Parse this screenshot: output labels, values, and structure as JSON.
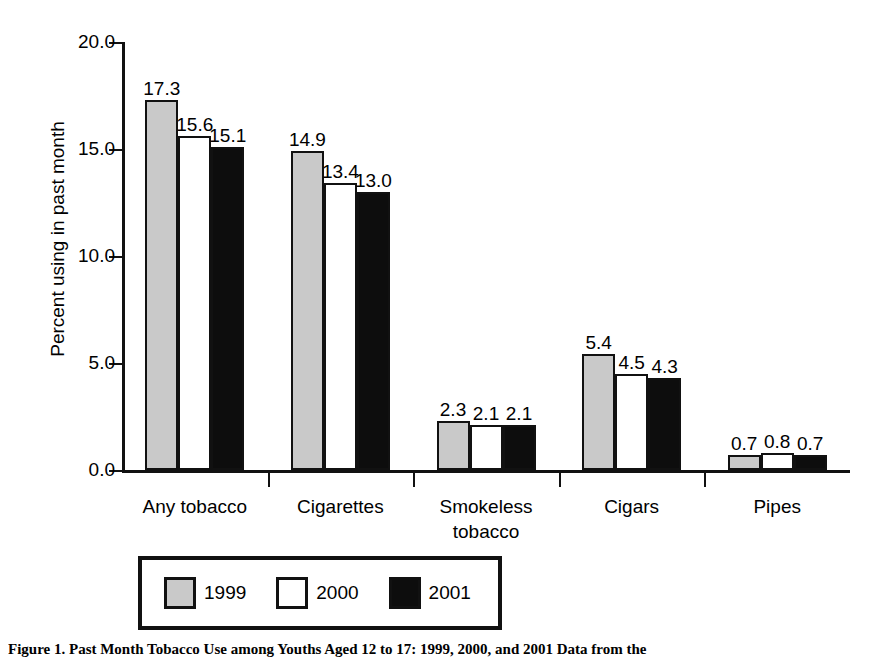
{
  "chart_data": {
    "type": "bar",
    "title": "",
    "xlabel": "",
    "ylabel": "Percent using in past month",
    "ylim": [
      0.0,
      20.0
    ],
    "yticks": [
      "0.0",
      "5.0",
      "10.0",
      "15.0",
      "20.0"
    ],
    "ytick_values": [
      0.0,
      5.0,
      10.0,
      15.0,
      20.0
    ],
    "grid": false,
    "legend_position": "bottom",
    "categories": [
      "Any tobacco",
      "Cigarettes",
      "Smokeless tobacco",
      "Cigars",
      "Pipes"
    ],
    "category_lines": [
      [
        "Any tobacco"
      ],
      [
        "Cigarettes"
      ],
      [
        "Smokeless",
        "tobacco"
      ],
      [
        "Cigars"
      ],
      [
        "Pipes"
      ]
    ],
    "series": [
      {
        "name": "1999",
        "color": "#c9c9c9",
        "values": [
          17.3,
          14.9,
          2.3,
          5.4,
          0.7
        ],
        "labels": [
          "17.3",
          "14.9",
          "2.3",
          "5.4",
          "0.7"
        ]
      },
      {
        "name": "2000",
        "color": "#ffffff",
        "values": [
          15.6,
          13.4,
          2.1,
          4.5,
          0.8
        ],
        "labels": [
          "15.6",
          "13.4",
          "2.1",
          "4.5",
          "0.8"
        ]
      },
      {
        "name": "2001",
        "color": "#0d0d0d",
        "values": [
          15.1,
          13.0,
          2.1,
          4.3,
          0.7
        ],
        "labels": [
          "15.1",
          "13.0",
          "2.1",
          "4.3",
          "0.7"
        ]
      }
    ]
  },
  "legend": {
    "items": [
      {
        "label": "1999",
        "swatch": "gray"
      },
      {
        "label": "2000",
        "swatch": "white"
      },
      {
        "label": "2001",
        "swatch": "black"
      }
    ]
  },
  "caption": {
    "text": "Figure 1. Past Month Tobacco Use among Youths Aged 12 to 17: 1999, 2000, and 2001 Data from the"
  },
  "colors": {
    "series_1999": "#c9c9c9",
    "series_2000": "#ffffff",
    "series_2001": "#0d0d0d",
    "axis": "#111111",
    "background": "#ffffff"
  }
}
